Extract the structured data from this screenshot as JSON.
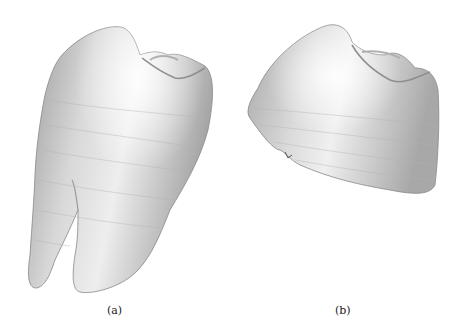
{
  "figure": {
    "panels": [
      {
        "id": "a",
        "label": "(a)",
        "subject": "full-tooth-3d-rendering"
      },
      {
        "id": "b",
        "label": "(b)",
        "subject": "tooth-crown-3d-rendering"
      }
    ],
    "colors": {
      "background": "#ffffff",
      "surface_light": "#f2f2f2",
      "surface_mid": "#c8c8c8",
      "surface_dark": "#8a8a8a"
    }
  }
}
